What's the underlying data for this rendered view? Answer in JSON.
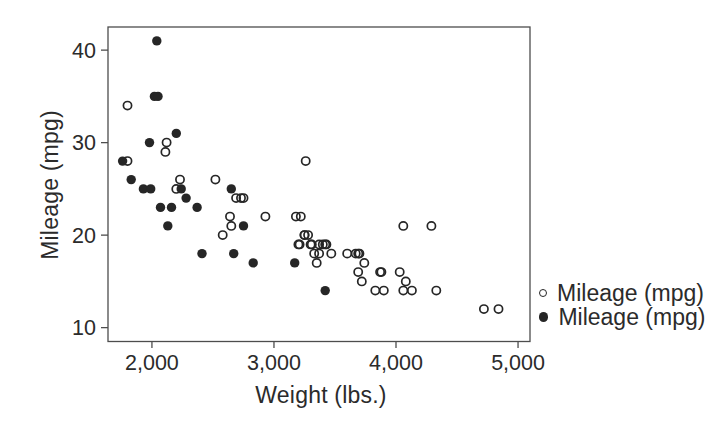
{
  "colors": {
    "background": "#ffffff",
    "text": "#2b2b2b",
    "frame": "#4d4d4d",
    "marker": "#262626"
  },
  "chart_data": {
    "type": "scatter",
    "title": "",
    "xlabel": "Weight (lbs.)",
    "ylabel": "Mileage (mpg)",
    "xlim": [
      1640,
      5098
    ],
    "ylim": [
      8.5,
      42.5
    ],
    "x_tick_values": [
      2000,
      3000,
      4000,
      5000
    ],
    "x_tick_labels": [
      "2,000",
      "3,000",
      "4,000",
      "5,000"
    ],
    "y_tick_values": [
      10,
      20,
      30,
      40
    ],
    "y_tick_labels": [
      "10",
      "20",
      "30",
      "40"
    ],
    "grid": false,
    "legend_position": "right-outside",
    "series": [
      {
        "name": "Mileage (mpg)",
        "marker": "open-circle",
        "color": "#262626",
        "points": [
          [
            2930,
            22
          ],
          [
            3350,
            17
          ],
          [
            2640,
            22
          ],
          [
            3250,
            20
          ],
          [
            4080,
            15
          ],
          [
            3670,
            18
          ],
          [
            2230,
            26
          ],
          [
            3280,
            20
          ],
          [
            3880,
            16
          ],
          [
            3400,
            19
          ],
          [
            4330,
            14
          ],
          [
            3900,
            14
          ],
          [
            4290,
            21
          ],
          [
            2110,
            29
          ],
          [
            3690,
            16
          ],
          [
            3180,
            22
          ],
          [
            3220,
            22
          ],
          [
            2750,
            24
          ],
          [
            3430,
            19
          ],
          [
            2120,
            30
          ],
          [
            3600,
            18
          ],
          [
            3870,
            16
          ],
          [
            3740,
            17
          ],
          [
            1800,
            28
          ],
          [
            2650,
            21
          ],
          [
            4840,
            12
          ],
          [
            4720,
            12
          ],
          [
            3830,
            14
          ],
          [
            2580,
            20
          ],
          [
            4060,
            14
          ],
          [
            3720,
            15
          ],
          [
            3370,
            18
          ],
          [
            4130,
            14
          ],
          [
            3250,
            20
          ],
          [
            4060,
            21
          ],
          [
            3300,
            19
          ],
          [
            3310,
            19
          ],
          [
            3690,
            18
          ],
          [
            3370,
            19
          ],
          [
            2730,
            24
          ],
          [
            4030,
            16
          ],
          [
            3260,
            28
          ],
          [
            1800,
            34
          ],
          [
            2200,
            25
          ],
          [
            2520,
            26
          ],
          [
            3330,
            18
          ],
          [
            3700,
            18
          ],
          [
            3470,
            18
          ],
          [
            3210,
            19
          ],
          [
            3200,
            19
          ],
          [
            3420,
            19
          ],
          [
            2690,
            24
          ]
        ]
      },
      {
        "name": "Mileage (mpg)",
        "marker": "filled-circle",
        "color": "#262626",
        "points": [
          [
            2830,
            17
          ],
          [
            2070,
            23
          ],
          [
            2650,
            25
          ],
          [
            2370,
            23
          ],
          [
            2020,
            35
          ],
          [
            2280,
            24
          ],
          [
            2750,
            21
          ],
          [
            2130,
            21
          ],
          [
            2240,
            25
          ],
          [
            1760,
            28
          ],
          [
            1980,
            30
          ],
          [
            3420,
            14
          ],
          [
            1830,
            26
          ],
          [
            2050,
            35
          ],
          [
            2410,
            18
          ],
          [
            2200,
            31
          ],
          [
            2670,
            18
          ],
          [
            2160,
            23
          ],
          [
            2040,
            41
          ],
          [
            1930,
            25
          ],
          [
            1990,
            25
          ],
          [
            3170,
            17
          ]
        ]
      }
    ]
  }
}
